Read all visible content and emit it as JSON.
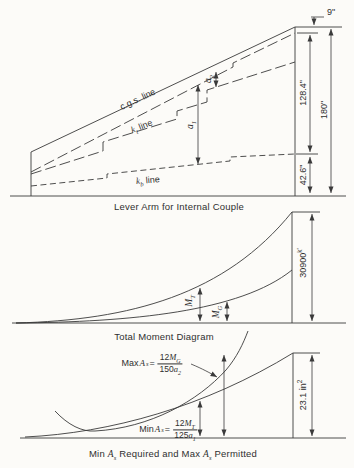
{
  "colors": {
    "ink": "#3a3a3a",
    "paper": "#fcfbf8"
  },
  "top": {
    "caption": "Lever Arm for Internal Couple",
    "cgs_label": "c.g.s. line",
    "kt": {
      "var": "k",
      "sub": "t",
      "rest": " line"
    },
    "kb": {
      "var": "k",
      "sub": "b",
      "rest": " line"
    },
    "a1": {
      "var": "a",
      "sub": "1"
    },
    "a2": {
      "var": "a",
      "sub": "2"
    },
    "dims": {
      "top_offset": "9\"",
      "cgs_to_kb": "128.4\"",
      "total_depth": "180\"",
      "kb_to_soffit": "42.6\""
    }
  },
  "middle": {
    "caption": "Total Moment Diagram",
    "mt": {
      "var": "M",
      "sub": "T"
    },
    "mg": {
      "var": "M",
      "sub": "G"
    },
    "dim": {
      "value": "30900",
      "sup": "k'"
    }
  },
  "bottom": {
    "caption": {
      "p1": "Min ",
      "v1": "A",
      "s1": "s",
      "p2": " Required and Max ",
      "v2": "A",
      "s2": "s",
      "p3": " Permitted"
    },
    "max_formula": {
      "prefix": "Max ",
      "var": "A",
      "sub": "s",
      "eq": " =",
      "num_pre": "12",
      "num_var": "M",
      "num_sub": "G",
      "den_pre": "150",
      "den_var": "a",
      "den_sub": "2"
    },
    "min_formula": {
      "prefix": "Min ",
      "var": "A",
      "sub": "s",
      "eq": " =",
      "num_pre": "12",
      "num_var": "M",
      "num_sub": "T",
      "den_pre": "125",
      "den_var": "a",
      "den_sub": "1"
    },
    "dim": {
      "value": "23.1 in",
      "sup": "2"
    }
  }
}
